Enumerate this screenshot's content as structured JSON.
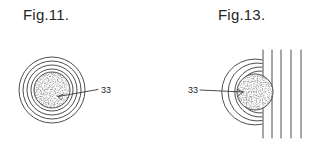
{
  "document": {
    "type": "patent-drawing-sheet",
    "background_color": "#ffffff",
    "ink_color": "#3a3a3a",
    "text_color": "#262626"
  },
  "figures": [
    {
      "id": "fig-11",
      "caption": "Fig.11.",
      "caption_position": {
        "x": 23,
        "y": 6
      },
      "description": "concentric circles with stippled core",
      "core": {
        "cx": 52,
        "cy": 90,
        "r": 18,
        "fill": "stipple"
      },
      "rings": [
        {
          "r": 21
        },
        {
          "r": 25
        },
        {
          "r": 29
        },
        {
          "r": 33
        }
      ],
      "reference_numeral": {
        "text": "33",
        "label_position": {
          "x": 101,
          "y": 85
        },
        "leader_from": {
          "x": 58,
          "y": 96
        },
        "leader_to": {
          "x": 98,
          "y": 89
        }
      }
    },
    {
      "id": "fig-13",
      "caption": "Fig.13.",
      "caption_position": {
        "x": 218,
        "y": 6
      },
      "description": "stippled circle with concentric arcs at left and parallel vertical lines at right",
      "core": {
        "cx": 255,
        "cy": 92,
        "r": 18,
        "fill": "stipple"
      },
      "arcs": [
        {
          "r": 21
        },
        {
          "r": 25
        },
        {
          "r": 29
        },
        {
          "r": 33
        }
      ],
      "vertical_lines": [
        {
          "x": 263,
          "y1": 50,
          "y2": 138
        },
        {
          "x": 272,
          "y1": 50,
          "y2": 138
        },
        {
          "x": 281,
          "y1": 50,
          "y2": 138
        },
        {
          "x": 291,
          "y1": 50,
          "y2": 138
        },
        {
          "x": 301,
          "y1": 50,
          "y2": 138
        }
      ],
      "reference_numeral": {
        "text": "33",
        "label_position": {
          "x": 188,
          "y": 85
        },
        "leader_from": {
          "x": 200,
          "y": 90
        },
        "leader_to": {
          "x": 243,
          "y": 92
        }
      }
    }
  ]
}
